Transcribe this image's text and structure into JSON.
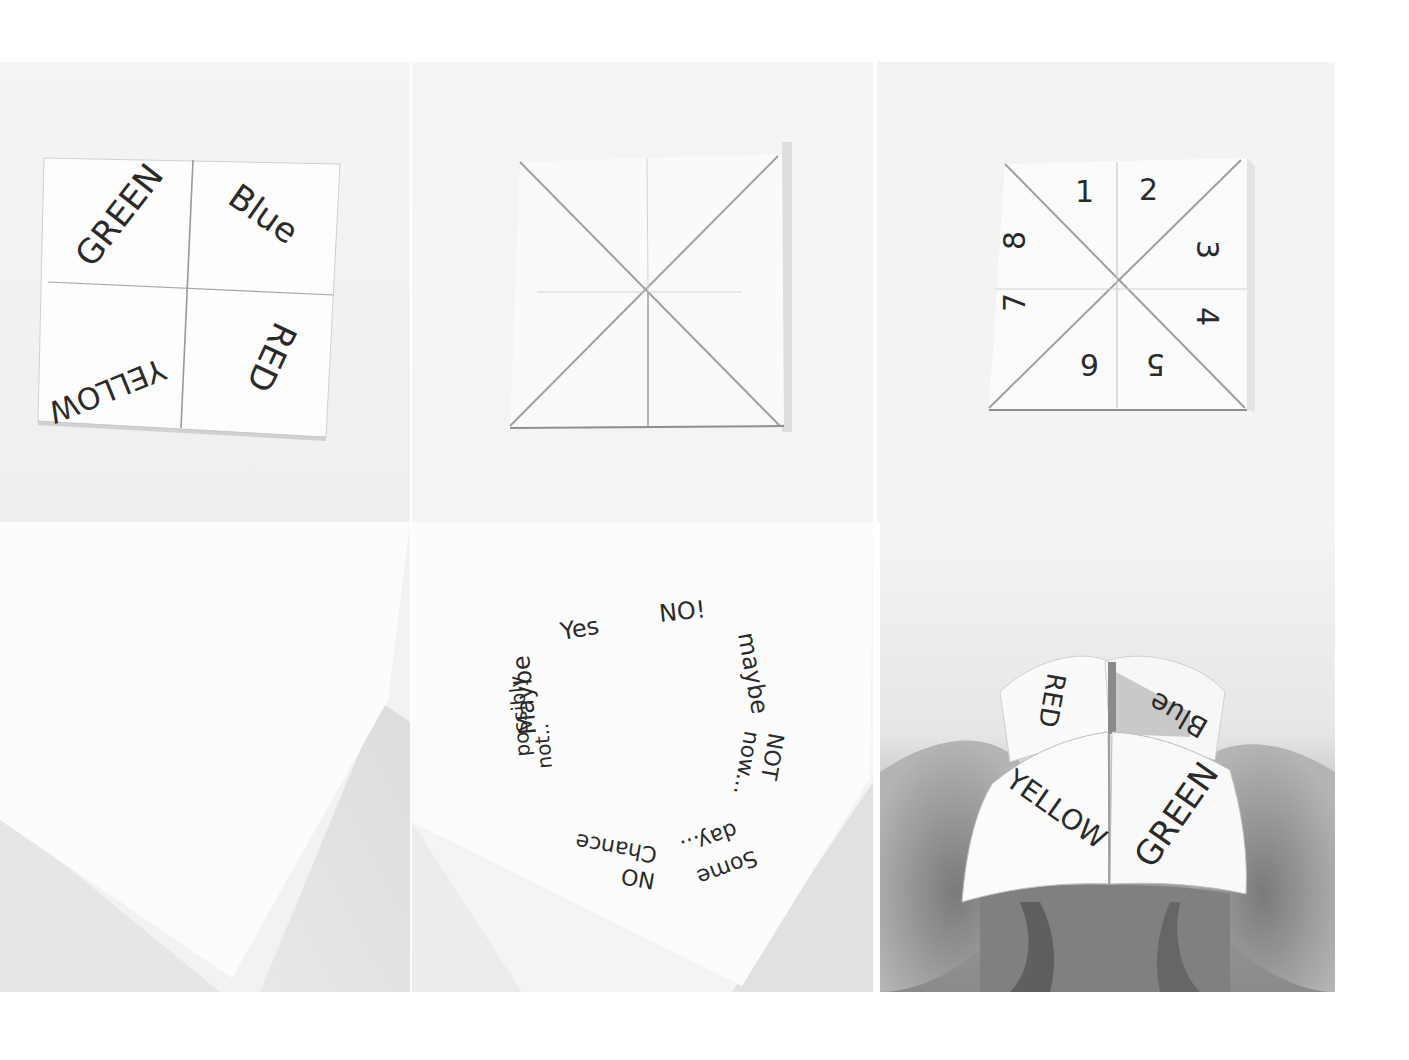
{
  "colors": {
    "background": "#ffffff",
    "paper": "#fbfbfb",
    "surface_light": "#f1f1f1",
    "fold_line": "#9a9a9a",
    "ink": "#2a2a2a",
    "hand_shadow": "#6a6a6a"
  },
  "panels": [
    {
      "step": 1,
      "caption": "Square paper creased into quarters with colors written in each quarter",
      "labels": {
        "top_left": "GREEN",
        "top_right": "Blue",
        "bottom_left": "YELLOW",
        "bottom_right": "RED"
      }
    },
    {
      "step": 2,
      "caption": "Paper flipped with corners folded to the center, showing diagonal creases"
    },
    {
      "step": 3,
      "caption": "Triangular flaps numbered 1 to 8",
      "numbers": [
        "1",
        "2",
        "3",
        "4",
        "5",
        "6",
        "7",
        "8"
      ]
    },
    {
      "step": 4,
      "caption": "Corner of the folded paper, blank"
    },
    {
      "step": 5,
      "caption": "Inner flaps with fortunes written in a circle",
      "fortunes": {
        "f1": "Yes",
        "f2": "NO!",
        "f3": "maybe",
        "f4_line1": "NOT",
        "f4_line2": "now...",
        "f5_line1": "Some",
        "f5_line2": "day...",
        "f6_line1": "NO",
        "f6_line2": "Chance",
        "f7_line1": "possibly",
        "f7_line2": "not..",
        "f8": "Maybe"
      }
    },
    {
      "step": 6,
      "caption": "Finished fortune teller held in fingers",
      "labels": {
        "back_left": "RED",
        "back_right": "Blue",
        "front_left": "YELLOW",
        "front_right": "GREEN"
      }
    }
  ]
}
